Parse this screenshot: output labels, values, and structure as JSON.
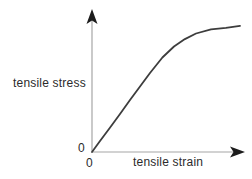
{
  "figure": {
    "y_axis_label": "tensile stress",
    "x_axis_label": "tensile strain",
    "origin_label_y": "0",
    "origin_label_x": "0"
  },
  "colors": {
    "background": "#ffffff",
    "axis_line": "#a6a6a6",
    "arrowhead": "#1c1c1c",
    "curve": "#3d3d3d",
    "text": "#2b2b2b"
  },
  "chart_data": {
    "type": "line",
    "title": "",
    "xlabel": "tensile strain",
    "ylabel": "tensile stress",
    "x_tick_labels": [
      "0"
    ],
    "y_tick_labels": [
      "0"
    ],
    "xlim": [
      0,
      1
    ],
    "ylim": [
      0,
      1
    ],
    "grid": false,
    "legend": "none",
    "axis_arrows": true,
    "series": [
      {
        "name": "stress-strain curve",
        "points": [
          [
            0.0,
            0.0
          ],
          [
            0.054,
            0.087
          ],
          [
            0.122,
            0.194
          ],
          [
            0.189,
            0.301
          ],
          [
            0.257,
            0.412
          ],
          [
            0.324,
            0.519
          ],
          [
            0.392,
            0.626
          ],
          [
            0.476,
            0.749
          ],
          [
            0.554,
            0.836
          ],
          [
            0.628,
            0.895
          ],
          [
            0.703,
            0.939
          ],
          [
            0.804,
            0.972
          ],
          [
            0.905,
            0.984
          ],
          [
            1.0,
            1.0
          ]
        ]
      }
    ]
  }
}
